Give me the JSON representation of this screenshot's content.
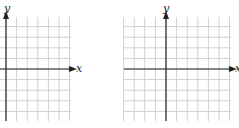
{
  "graphs": [
    {
      "id": "left",
      "x_label": "x",
      "y_label": "y",
      "grid": {
        "left": 0,
        "top": 17,
        "right": 71,
        "bottom": 121,
        "cell": 10.6
      },
      "origin": {
        "x": 6,
        "y": 69
      }
    },
    {
      "id": "right",
      "x_label": "x",
      "y_label": "y",
      "grid": {
        "left": 124,
        "top": 17,
        "right": 231,
        "bottom": 121,
        "cell": 10.6
      },
      "origin": {
        "x": 166,
        "y": 69
      }
    }
  ],
  "colors": {
    "grid": "#d0d0d0",
    "axis": "#222222",
    "background": "#ffffff"
  }
}
